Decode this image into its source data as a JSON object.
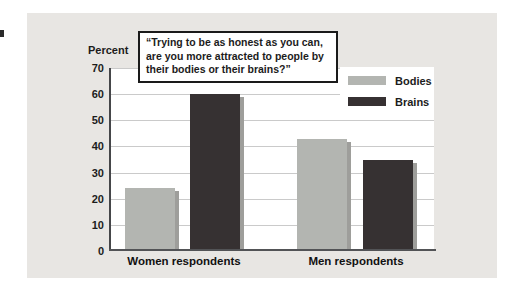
{
  "figure": {
    "y_axis_title": "Percent"
  },
  "chart_data": {
    "type": "bar",
    "categories": [
      "Women respondents",
      "Men respondents"
    ],
    "series": [
      {
        "name": "Bodies",
        "values": [
          24,
          43
        ],
        "color": "#b3b5b1"
      },
      {
        "name": "Brains",
        "values": [
          60,
          35
        ],
        "color": "#363132"
      }
    ],
    "title": "",
    "xlabel": "",
    "ylabel": "Percent",
    "ylim": [
      0,
      70
    ],
    "ytick_step": 10,
    "grid": true,
    "legend_position": "top-right",
    "legend_entries": [
      "Bodies",
      "Brains"
    ],
    "annotation": "“Trying to be as honest as you can, are you more attracted to people by their bodies or their brains?”"
  },
  "colors": {
    "panel_bg": "#e8e6e3",
    "plot_bg": "#ffffff",
    "gridline": "#cacaca",
    "axis": "#454649",
    "bar_shadow": "#9e9e9b",
    "text": "#1c1c1c"
  }
}
